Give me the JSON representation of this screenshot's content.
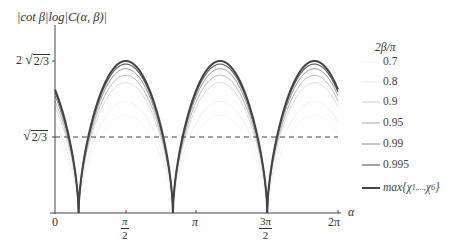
{
  "chart_data": {
    "type": "line",
    "title": "",
    "ylabel": "|cot β| log|C(α, β)|",
    "xlabel": "α",
    "x_range": [
      0,
      6.2832
    ],
    "y_range": [
      0,
      1.7
    ],
    "grid": false,
    "x_ticks": [
      {
        "value": 0,
        "label": "0"
      },
      {
        "value": 1.5708,
        "label_num": "π",
        "label_den": "2"
      },
      {
        "value": 3.1416,
        "label": "π"
      },
      {
        "value": 4.7124,
        "label_num": "3π",
        "label_den": "2"
      },
      {
        "value": 6.2832,
        "label": "2π"
      }
    ],
    "y_ticks": [
      {
        "value": 0.8165,
        "label_prefix": "",
        "label_radicand": "2/3"
      },
      {
        "value": 1.633,
        "label_prefix": "2",
        "label_radicand": "2/3"
      }
    ],
    "reference_line": {
      "value": 0.8165,
      "style": "dashed",
      "label": "√(2/3)"
    },
    "legend_title": "2β/π",
    "legend_position": "right",
    "minima_x": [
      0.5236,
      2.618,
      4.7124
    ],
    "maxima_x": [
      1.5708,
      3.6652,
      5.7596
    ],
    "series": [
      {
        "name": "0.7",
        "amplitude": 1.05,
        "color": "#f0f0f0",
        "width": 0.7
      },
      {
        "name": "0.8",
        "amplitude": 1.2,
        "color": "#e6e6e6",
        "width": 0.7
      },
      {
        "name": "0.9",
        "amplitude": 1.4,
        "color": "#cfcfcf",
        "width": 0.8
      },
      {
        "name": "0.95",
        "amplitude": 1.48,
        "color": "#aaaaaa",
        "width": 0.9
      },
      {
        "name": "0.99",
        "amplitude": 1.55,
        "color": "#888888",
        "width": 1.0
      },
      {
        "name": "0.995",
        "amplitude": 1.6,
        "color": "#666666",
        "width": 1.2
      },
      {
        "name": "max{χ1,...,χ6}",
        "amplitude": 1.633,
        "color": "#444444",
        "width": 2.0
      }
    ]
  },
  "labels": {
    "ylabel": "|cot β|log|C(α, β)|",
    "xlabel": "α",
    "y_tick_top_prefix": "2",
    "y_tick_radicand": "2/3",
    "x0": "0",
    "x_pi": "π",
    "x_2pi": "2π",
    "x_half_num": "π",
    "x_half_den": "2",
    "x_3half_num": "3π",
    "x_3half_den": "2",
    "legend_title": "2β/π",
    "legend_items": [
      "0.7",
      "0.8",
      "0.9",
      "0.95",
      "0.99",
      "0.995"
    ],
    "legend_max": "max{χ",
    "legend_max_sub1": "1,...,",
    "legend_max_chi": "χ",
    "legend_max_sub2": "6",
    "legend_max_close": "}"
  }
}
